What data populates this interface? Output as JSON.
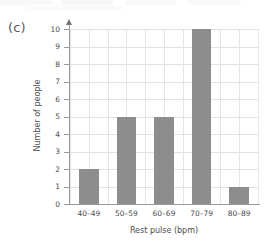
{
  "figure": {
    "panel_label": "(c)"
  },
  "chart_data": {
    "type": "bar",
    "title": "",
    "xlabel": "Rest pulse (bpm)",
    "ylabel": "Number of people",
    "categories": [
      "40–49",
      "50–59",
      "60–69",
      "70–79",
      "80–89"
    ],
    "values": [
      2,
      5,
      5,
      10,
      1
    ],
    "ylim": [
      0,
      10
    ],
    "y_ticks": [
      0,
      1,
      2,
      3,
      4,
      5,
      6,
      7,
      8,
      9,
      10
    ],
    "y_tick_labels": [
      "0",
      "1",
      "2",
      "3",
      "4",
      "5",
      "6",
      "7",
      "8",
      "9",
      "10"
    ],
    "grid": true,
    "legend": "none",
    "bar_color": "#8d8d8d",
    "grid_color": "#e2e2e2",
    "axis_color": "#9a9a9a"
  }
}
